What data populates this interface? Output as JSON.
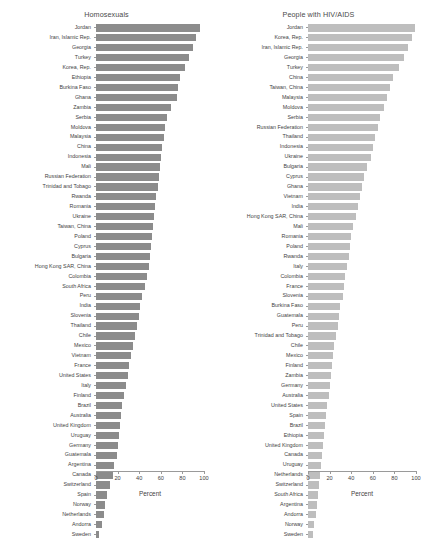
{
  "chart_data": [
    {
      "type": "bar",
      "orientation": "horizontal",
      "title": "Homosexuals",
      "xlabel": "Percent",
      "ylabel": "",
      "xlim": [
        0,
        100
      ],
      "xticks": [
        0,
        20,
        40,
        60,
        80,
        100
      ],
      "grid": false,
      "legend": "none",
      "bar_color": "#8c8c8c",
      "categories": [
        "Jordan",
        "Iran, Islamic Rep.",
        "Georgia",
        "Turkey",
        "Korea, Rep.",
        "Ethiopia",
        "Burkina Faso",
        "Ghana",
        "Zambia",
        "Serbia",
        "Moldova",
        "Malaysia",
        "China",
        "Indonesia",
        "Mali",
        "Russian Federation",
        "Trinidad and Tobago",
        "Rwanda",
        "Romania",
        "Ukraine",
        "Taiwan, China",
        "Poland",
        "Cyprus",
        "Bulgaria",
        "Hong Kong SAR, China",
        "Colombia",
        "South Africa",
        "Peru",
        "India",
        "Slovenia",
        "Thailand",
        "Chile",
        "Mexico",
        "Vietnam",
        "France",
        "United States",
        "Italy",
        "Finland",
        "Brazil",
        "Australia",
        "United Kingdom",
        "Uruguay",
        "Germany",
        "Guatemala",
        "Argentina",
        "Canada",
        "Switzerland",
        "Spain",
        "Norway",
        "Netherlands",
        "Andorra",
        "Sweden"
      ],
      "values": [
        96,
        93,
        90,
        86,
        82,
        78,
        76,
        75,
        69,
        66,
        64,
        63,
        61,
        60,
        59,
        58,
        57,
        56,
        55,
        54,
        53,
        52,
        51,
        50,
        49,
        47,
        45,
        43,
        41,
        40,
        38,
        36,
        34,
        32,
        31,
        30,
        28,
        26,
        24,
        23,
        22,
        21,
        20,
        19,
        17,
        16,
        13,
        10,
        8,
        7,
        6,
        3
      ]
    },
    {
      "type": "bar",
      "orientation": "horizontal",
      "title": "People with HIV/AIDS",
      "xlabel": "Percent",
      "ylabel": "",
      "xlim": [
        0,
        100
      ],
      "xticks": [
        0,
        20,
        40,
        60,
        80,
        100
      ],
      "grid": false,
      "legend": "none",
      "bar_color": "#bebebe",
      "categories": [
        "Jordan",
        "Korea, Rep.",
        "Iran, Islamic Rep.",
        "Georgia",
        "Turkey",
        "China",
        "Taiwan, China",
        "Malaysia",
        "Moldova",
        "Serbia",
        "Russian Federation",
        "Thailand",
        "Indonesia",
        "Ukraine",
        "Bulgaria",
        "Cyprus",
        "Ghana",
        "Vietnam",
        "India",
        "Hong Kong SAR, China",
        "Mali",
        "Romania",
        "Poland",
        "Rwanda",
        "Italy",
        "Colombia",
        "France",
        "Slovenia",
        "Burkina Faso",
        "Guatemala",
        "Peru",
        "Trinidad and Tobago",
        "Chile",
        "Mexico",
        "Finland",
        "Zambia",
        "Germany",
        "Australia",
        "United States",
        "Spain",
        "Brazil",
        "Ethiopia",
        "United Kingdom",
        "Canada",
        "Uruguay",
        "Netherlands",
        "Switzerland",
        "South Africa",
        "Argentina",
        "Andorra",
        "Norway",
        "Sweden"
      ],
      "values": [
        99,
        96,
        93,
        89,
        84,
        79,
        76,
        73,
        70,
        67,
        65,
        62,
        60,
        58,
        55,
        52,
        50,
        48,
        46,
        44,
        42,
        40,
        39,
        38,
        36,
        34,
        33,
        32,
        30,
        29,
        28,
        26,
        24,
        23,
        22,
        21,
        20,
        19,
        18,
        17,
        16,
        15,
        14,
        13,
        12,
        11,
        10,
        9,
        8,
        7,
        6,
        5
      ]
    }
  ]
}
